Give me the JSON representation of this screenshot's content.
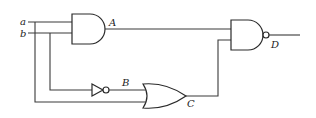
{
  "diagram": {
    "type": "logic-circuit",
    "inputs": [
      {
        "id": "a",
        "label": "a"
      },
      {
        "id": "b",
        "label": "b"
      }
    ],
    "gates": [
      {
        "id": "A",
        "label": "A",
        "kind": "AND",
        "inputs": [
          "a",
          "b"
        ]
      },
      {
        "id": "B",
        "label": "B",
        "kind": "NOT",
        "inputs": [
          "b"
        ]
      },
      {
        "id": "C",
        "label": "C",
        "kind": "OR",
        "inputs": [
          "B",
          "a"
        ]
      },
      {
        "id": "D",
        "label": "D",
        "kind": "NAND",
        "inputs": [
          "A",
          "C"
        ]
      }
    ],
    "output": "D",
    "colors": {
      "line": "#3a3a3a",
      "background": "#ffffff"
    }
  }
}
